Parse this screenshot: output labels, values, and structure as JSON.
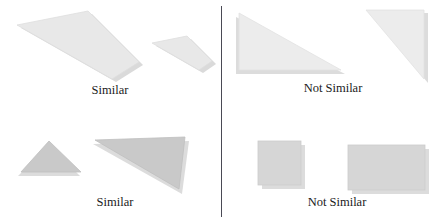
{
  "figure": {
    "divider": {
      "name": "vertical-divider",
      "color": "#4a4a55"
    },
    "palette": {
      "shape_fill_light": "#e6e6e6",
      "shape_fill_mid": "#dcdcdc",
      "shape_fill_dark": "#c9c9c9",
      "shape_stroke": "#d0d0d0",
      "shadow": "#d9d9d9",
      "caption_color": "#1a1a1a",
      "background": "#ffffff"
    },
    "quadrants": [
      {
        "id": "top-left",
        "caption": "Similar",
        "relation": "similar",
        "shapes": [
          {
            "name": "large-quadrilateral",
            "kind": "quadrilateral",
            "points": "17,25 88,11 139,62 112,79",
            "fill": "#e8e8e8"
          },
          {
            "name": "small-quadrilateral",
            "kind": "quadrilateral",
            "points": "152,43 187,36 212,61 199,70",
            "fill": "#e8e8e8"
          }
        ]
      },
      {
        "id": "top-right",
        "caption": "Not Similar",
        "relation": "not-similar",
        "shapes": [
          {
            "name": "right-triangle-wide",
            "kind": "triangle",
            "points": "239,13 239,70 341,70",
            "fill": "#ececec"
          },
          {
            "name": "right-triangle-tall",
            "kind": "triangle",
            "points": "366,10 424,10 424,79",
            "fill": "#ececec"
          }
        ]
      },
      {
        "id": "bottom-left",
        "caption": "Similar",
        "relation": "similar",
        "shapes": [
          {
            "name": "small-triangle",
            "kind": "triangle",
            "points": "49,141 21,172 81,172",
            "fill": "#c9c9c9"
          },
          {
            "name": "large-triangle",
            "kind": "triangle",
            "points": "185,137 95,140 179,189",
            "fill": "#c9c9c9"
          }
        ]
      },
      {
        "id": "bottom-right",
        "caption": "Not Similar",
        "relation": "not-similar",
        "shapes": [
          {
            "name": "small-square",
            "kind": "rectangle",
            "points": "258,141 301,141 301,185 258,185",
            "fill": "#d6d6d6"
          },
          {
            "name": "wide-rectangle",
            "kind": "rectangle",
            "points": "348,145 425,145 425,190 348,190",
            "fill": "#d6d6d6"
          }
        ]
      }
    ]
  }
}
